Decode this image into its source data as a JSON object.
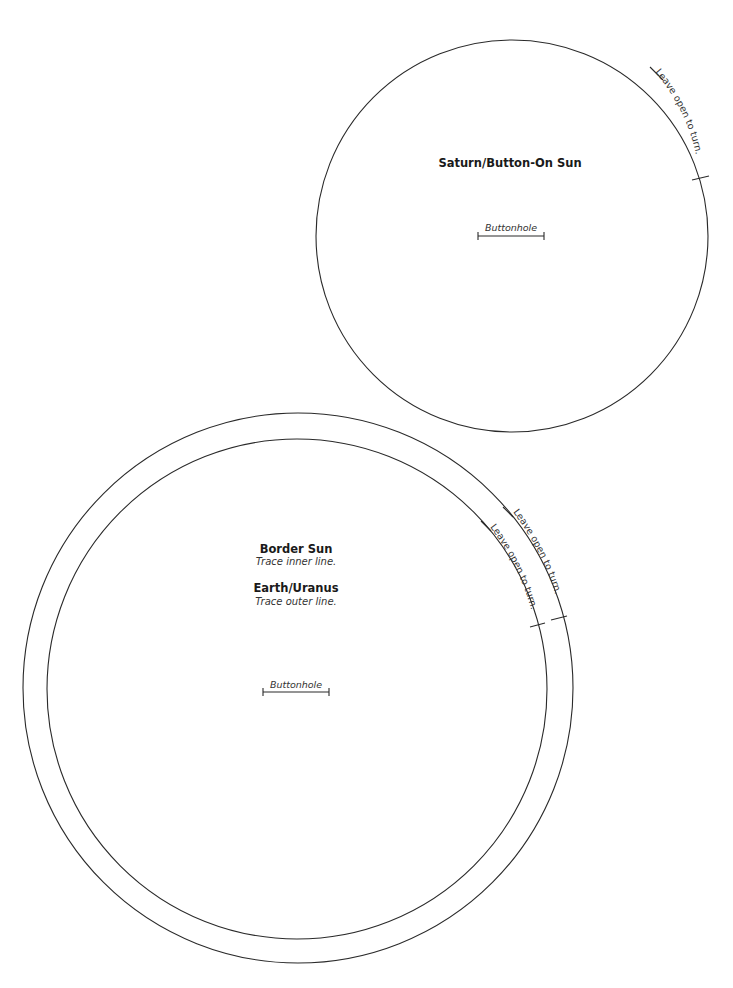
{
  "pieces": {
    "saturn": {
      "title": "Saturn/Button-On Sun",
      "buttonhole_label": "Buttonhole",
      "opening_label": "Leave open to turn."
    },
    "border_earth": {
      "border_title": "Border Sun",
      "border_instruction": "Trace inner line.",
      "earth_title": "Earth/Uranus",
      "earth_instruction": "Trace outer line.",
      "buttonhole_label": "Buttonhole",
      "outer_opening_label": "Leave open to turn.",
      "inner_opening_label": "Leave open to turn."
    }
  },
  "colors": {
    "line": "#2a2a2a",
    "text": "#1a1a1a",
    "background": "#ffffff"
  }
}
